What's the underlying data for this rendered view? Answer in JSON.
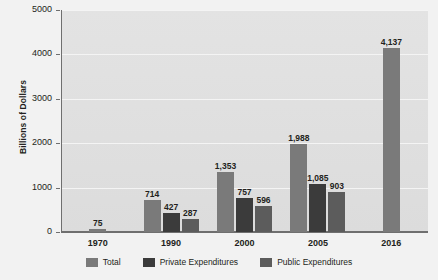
{
  "chart_data": {
    "type": "bar",
    "title": "",
    "xlabel": "",
    "ylabel": "Billions of Dollars",
    "ylim": [
      0,
      5000
    ],
    "yticks": [
      0,
      1000,
      2000,
      3000,
      4000,
      5000
    ],
    "ytick_labels": [
      "0",
      "1000",
      "2000",
      "3000",
      "4000",
      "5000"
    ],
    "grid": true,
    "legend_position": "bottom",
    "categories": [
      "1970",
      "1990",
      "2000",
      "2005",
      "2016"
    ],
    "series": [
      {
        "name": "Total",
        "color": "#7a7a7a",
        "values": [
          75,
          714,
          1353,
          1988,
          4137
        ],
        "labels": [
          "75",
          "714",
          "1,353",
          "1,988",
          "4,137"
        ]
      },
      {
        "name": "Private Expenditures",
        "color": "#3b3b3b",
        "values": [
          null,
          427,
          757,
          1085,
          null
        ],
        "labels": [
          "",
          "427",
          "757",
          "1,085",
          ""
        ]
      },
      {
        "name": "Public Expenditures",
        "color": "#5c5c5c",
        "values": [
          null,
          287,
          596,
          903,
          null
        ],
        "labels": [
          "",
          "287",
          "596",
          "903",
          ""
        ]
      }
    ]
  }
}
